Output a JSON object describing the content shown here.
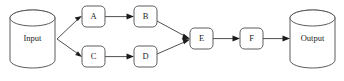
{
  "diagram": {
    "type": "flowchart",
    "orientation": "left-to-right",
    "background_color": "#ffffff",
    "line_color": "#3c3c3c",
    "text_color": "#1c1c1c",
    "nodes": [
      {
        "id": "input",
        "label": "Input",
        "shape": "cylinder",
        "x": 10,
        "y": 10,
        "w": 45,
        "h": 58
      },
      {
        "id": "a",
        "label": "A",
        "shape": "rounded-rect",
        "x": 82,
        "y": 6,
        "w": 23,
        "h": 21
      },
      {
        "id": "b",
        "label": "B",
        "shape": "rounded-rect",
        "x": 134,
        "y": 6,
        "w": 23,
        "h": 21
      },
      {
        "id": "c",
        "label": "C",
        "shape": "rounded-rect",
        "x": 82,
        "y": 46,
        "w": 23,
        "h": 21
      },
      {
        "id": "d",
        "label": "D",
        "shape": "rounded-rect",
        "x": 134,
        "y": 46,
        "w": 23,
        "h": 21
      },
      {
        "id": "e",
        "label": "E",
        "shape": "rounded-rect",
        "x": 190,
        "y": 28,
        "w": 23,
        "h": 21
      },
      {
        "id": "f",
        "label": "F",
        "shape": "rounded-rect",
        "x": 240,
        "y": 28,
        "w": 23,
        "h": 21
      },
      {
        "id": "output",
        "label": "Output",
        "shape": "cylinder",
        "x": 290,
        "y": 10,
        "w": 45,
        "h": 58
      }
    ],
    "edges": [
      {
        "from": "input",
        "to": "a",
        "arrow": true
      },
      {
        "from": "input",
        "to": "c",
        "arrow": true
      },
      {
        "from": "a",
        "to": "b",
        "arrow": true
      },
      {
        "from": "c",
        "to": "d",
        "arrow": true
      },
      {
        "from": "b",
        "to": "e",
        "arrow": true
      },
      {
        "from": "d",
        "to": "e",
        "arrow": true
      },
      {
        "from": "e",
        "to": "f",
        "arrow": true
      },
      {
        "from": "f",
        "to": "output",
        "arrow": true
      }
    ]
  }
}
